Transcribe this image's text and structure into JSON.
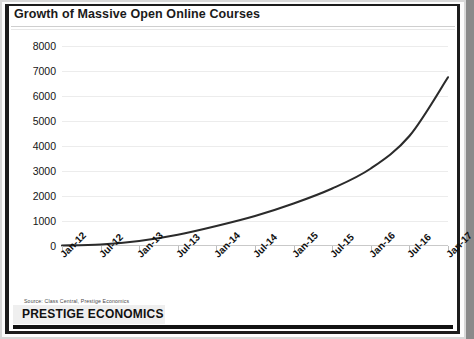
{
  "chart_data": {
    "type": "line",
    "title": "Growth of Massive Open Online Courses",
    "xlabel": "",
    "ylabel": "",
    "ylim": [
      0,
      8000
    ],
    "ytick_step": 1000,
    "grid": true,
    "legend": "none",
    "line_color": "#2b2b2b",
    "categories": [
      "Jan-12",
      "Jul-12",
      "Jan-13",
      "Jul-13",
      "Jan-14",
      "Jul-14",
      "Jan-15",
      "Jul-15",
      "Jan-16",
      "Jul-16",
      "Jan-17"
    ],
    "values": [
      20,
      60,
      200,
      450,
      800,
      1200,
      1700,
      2300,
      3100,
      4400,
      6750
    ],
    "ytick_labels": [
      "8000",
      "7000",
      "6000",
      "5000",
      "4000",
      "3000",
      "2000",
      "1000",
      "0"
    ],
    "annotations": [
      "Source: Class Central, Prestige Economics"
    ]
  },
  "header": {
    "title": "Growth of Massive Open Online Courses"
  },
  "footer": {
    "source": "Source: Class Central, Prestige Economics",
    "brand": "PRESTIGE ECONOMICS"
  }
}
